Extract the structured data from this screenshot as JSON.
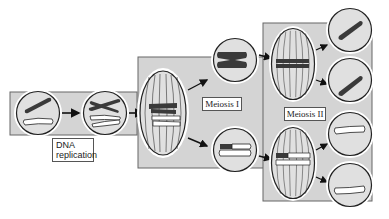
{
  "diagram": {
    "type": "meiosis-process",
    "colors": {
      "panel_fill": "#d4d4d4",
      "panel_stroke": "#666666",
      "cell_fill": "#e0e0e0",
      "cell_ring": "#ffffff",
      "outline": "#222222",
      "dark_chromosome": "#3a3a3a",
      "light_chromosome": "#ffffff"
    },
    "stages": [
      {
        "id": "pre-replication",
        "label": "DNA replication",
        "cells": 2
      },
      {
        "id": "meiosis-1",
        "label": "Meiosis I",
        "cells": 3
      },
      {
        "id": "meiosis-2",
        "label": "Meiosis II",
        "cells": 6
      }
    ],
    "labels": {
      "dna_replication_line1": "DNA",
      "dna_replication_line2": "replication",
      "meiosis_1": "Meiosis I",
      "meiosis_2": "Meiosis II"
    }
  }
}
